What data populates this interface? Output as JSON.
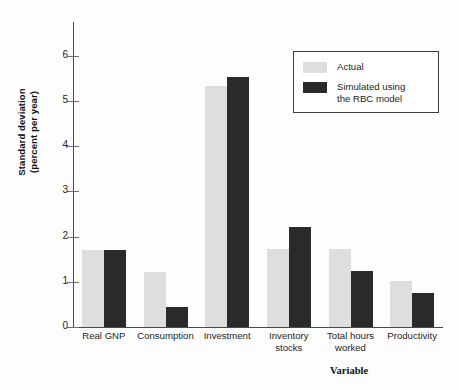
{
  "chart_data": {
    "type": "bar",
    "title": "",
    "xlabel": "Variable",
    "ylabel_line1": "Standard deviation",
    "ylabel_line2": "(percent per year)",
    "categories": [
      "Real GNP",
      "Consumption",
      "Investment",
      "Inventory stocks",
      "Total hours worked",
      "Productivity"
    ],
    "category_lines": [
      [
        "Real GNP",
        ""
      ],
      [
        "Consumption",
        ""
      ],
      [
        "Investment",
        ""
      ],
      [
        "Inventory",
        "stocks"
      ],
      [
        "Total hours",
        "worked"
      ],
      [
        "Productivity",
        ""
      ]
    ],
    "series": [
      {
        "name": "Actual",
        "color": "#dedede",
        "values": [
          1.7,
          1.22,
          5.33,
          1.72,
          1.73,
          1.02
        ]
      },
      {
        "name": "Simulated using the RBC model",
        "color": "#2a2a2a",
        "values": [
          1.7,
          0.45,
          5.53,
          2.22,
          1.25,
          0.75
        ]
      }
    ],
    "ylim": [
      0,
      6.75
    ],
    "yticks": [
      "0",
      "1",
      "2",
      "3",
      "4",
      "5",
      "6"
    ],
    "ytick_values": [
      0,
      1,
      2,
      3,
      4,
      5,
      6
    ],
    "grid": false,
    "legend_position": "top-right"
  },
  "legend": {
    "entries": [
      {
        "label": "Actual",
        "label2": ""
      },
      {
        "label": "Simulated using",
        "label2": "the RBC model"
      }
    ]
  }
}
